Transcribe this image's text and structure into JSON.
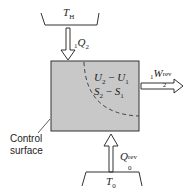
{
  "diagram": {
    "hot_reservoir": {
      "label": "T",
      "sub": "H"
    },
    "heat_in": {
      "pre": "1",
      "symbol": "Q",
      "sub": "2"
    },
    "system": {
      "line1": {
        "a": "U",
        "a_sub": "2",
        "op": " − ",
        "b": "U",
        "b_sub": "1"
      },
      "line2": {
        "a": "S",
        "a_sub": "2",
        "op": " − ",
        "b": "S",
        "b_sub": "1"
      }
    },
    "work_out": {
      "pre": "1",
      "symbol": "W",
      "sub": "2",
      "sup": "rev"
    },
    "heat_ambient": {
      "symbol": "Q",
      "sub": "0",
      "sup": "rev"
    },
    "ambient_reservoir": {
      "label": "T",
      "sub": "0"
    },
    "control_surface_label": [
      "Control",
      "surface"
    ],
    "colors": {
      "box_fill": "#c8c8c8",
      "stroke": "#333333"
    }
  }
}
